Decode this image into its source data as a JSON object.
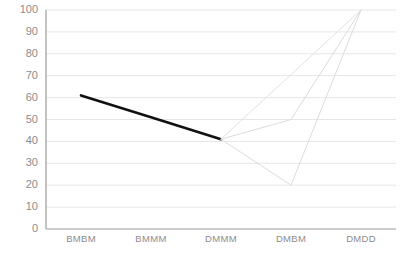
{
  "chart_data": {
    "type": "line",
    "title": "",
    "xlabel": "",
    "ylabel": "",
    "categories": [
      "BMBM",
      "BMMM",
      "DMMM",
      "DMBM",
      "DMDD"
    ],
    "ylim": [
      0,
      100
    ],
    "yticks": [
      0,
      10,
      20,
      30,
      40,
      50,
      60,
      70,
      80,
      90,
      100
    ],
    "ytick_labels": [
      "0",
      "10",
      "20",
      "30",
      "40",
      "50",
      "60",
      "70",
      "80",
      "90",
      "100"
    ],
    "grid": true,
    "grid_color": "#e6e6e6",
    "legend": "none",
    "series": [
      {
        "name": "series-1",
        "color": "#111111",
        "width": 2.6,
        "points": [
          {
            "x": "BMBM",
            "y": 61
          },
          {
            "x": "BMMM",
            "y": 51
          },
          {
            "x": "DMMM",
            "y": 41
          },
          {
            "x": "DMBM",
            "y": null
          },
          {
            "x": "DMDD",
            "y": null
          }
        ]
      },
      {
        "name": "series-2",
        "color": "#dcdcdc",
        "width": 1,
        "points": [
          {
            "x": "DMMM",
            "y": 41
          },
          {
            "x": "DMBM",
            "y": 50
          },
          {
            "x": "DMDD",
            "y": 100
          }
        ]
      },
      {
        "name": "series-3",
        "color": "#dcdcdc",
        "width": 1,
        "points": [
          {
            "x": "DMMM",
            "y": 41
          },
          {
            "x": "DMBM",
            "y": 20
          },
          {
            "x": "DMDD",
            "y": 100
          }
        ]
      },
      {
        "name": "series-4",
        "color": "#e2e2e2",
        "width": 1,
        "points": [
          {
            "x": "DMMM",
            "y": 41
          },
          {
            "x": "DMDD",
            "y": 100
          }
        ]
      }
    ]
  },
  "axes": {
    "y_axis_line_color": "#9a9a9a",
    "x_axis_line_color": "#9a9a9a"
  }
}
